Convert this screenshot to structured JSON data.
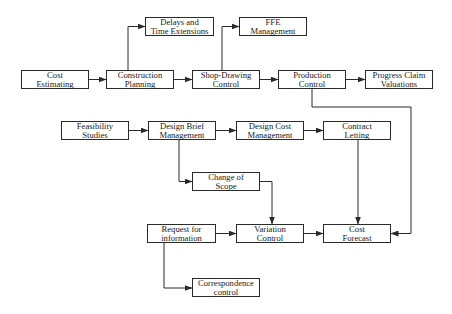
{
  "diagram": {
    "type": "flowchart",
    "colors": {
      "stroke": "#2a2a2a",
      "text": "#1a1a1a",
      "background": "#ffffff"
    },
    "nodes": [
      {
        "id": "cost_estimating",
        "label": "Cost\nEstimating",
        "x": 21,
        "y": 70,
        "w": 68,
        "h": 19
      },
      {
        "id": "construction_planning",
        "label": "Construction\nPlanning",
        "x": 106,
        "y": 70,
        "w": 68,
        "h": 19
      },
      {
        "id": "delays_time_extensions",
        "label": "Delays and\nTime Extensions",
        "x": 145,
        "y": 17,
        "w": 69,
        "h": 19
      },
      {
        "id": "shop_drawing_control",
        "label": "Shop-Drawing\nControl",
        "x": 192,
        "y": 70,
        "w": 68,
        "h": 19
      },
      {
        "id": "ffe_management",
        "label": "FFE\nManagement",
        "x": 239,
        "y": 17,
        "w": 68,
        "h": 19
      },
      {
        "id": "production_control",
        "label": "Production\nControl",
        "x": 278,
        "y": 70,
        "w": 68,
        "h": 19
      },
      {
        "id": "progress_claim_valuations",
        "label": "Progress Claim\nValuations",
        "x": 365,
        "y": 70,
        "w": 68,
        "h": 19
      },
      {
        "id": "feasibility_studies",
        "label": "Feasibility\nStudies",
        "x": 61,
        "y": 121,
        "w": 68,
        "h": 19
      },
      {
        "id": "design_brief_management",
        "label": "Design Brief\nManagement",
        "x": 148,
        "y": 121,
        "w": 68,
        "h": 19
      },
      {
        "id": "design_cost_management",
        "label": "Design Cost\nManagement",
        "x": 236,
        "y": 121,
        "w": 68,
        "h": 19
      },
      {
        "id": "contract_letting",
        "label": "Contract\nLetting",
        "x": 323,
        "y": 121,
        "w": 68,
        "h": 19
      },
      {
        "id": "change_of_scope",
        "label": "Change of\nScope",
        "x": 192,
        "y": 172,
        "w": 68,
        "h": 19
      },
      {
        "id": "request_for_information",
        "label": "Request for\ninformation",
        "x": 147,
        "y": 224,
        "w": 69,
        "h": 19
      },
      {
        "id": "variation_control",
        "label": "Variation\nControl",
        "x": 236,
        "y": 224,
        "w": 68,
        "h": 19
      },
      {
        "id": "cost_forecast",
        "label": "Cost\nForecast",
        "x": 323,
        "y": 224,
        "w": 68,
        "h": 19
      },
      {
        "id": "correspondence_control",
        "label": "Correspondence\ncontrol",
        "x": 192,
        "y": 278,
        "w": 68,
        "h": 19
      }
    ],
    "edges": [
      {
        "from": "cost_estimating",
        "to": "construction_planning",
        "points": [
          [
            89,
            79.5
          ],
          [
            106,
            79.5
          ]
        ]
      },
      {
        "from": "construction_planning",
        "to": "shop_drawing_control",
        "points": [
          [
            174,
            79.5
          ],
          [
            192,
            79.5
          ]
        ]
      },
      {
        "from": "shop_drawing_control",
        "to": "production_control",
        "points": [
          [
            260,
            79.5
          ],
          [
            278,
            79.5
          ]
        ]
      },
      {
        "from": "production_control",
        "to": "progress_claim_valuations",
        "points": [
          [
            346,
            79.5
          ],
          [
            365,
            79.5
          ]
        ]
      },
      {
        "from": "construction_planning",
        "to": "delays_time_extensions",
        "points": [
          [
            128,
            70
          ],
          [
            128,
            26.5
          ],
          [
            145,
            26.5
          ]
        ]
      },
      {
        "from": "shop_drawing_control",
        "to": "ffe_management",
        "points": [
          [
            222,
            70
          ],
          [
            222,
            26.5
          ],
          [
            239,
            26.5
          ]
        ]
      },
      {
        "from": "feasibility_studies",
        "to": "design_brief_management",
        "points": [
          [
            129,
            130.5
          ],
          [
            148,
            130.5
          ]
        ]
      },
      {
        "from": "design_brief_management",
        "to": "design_cost_management",
        "points": [
          [
            216,
            130.5
          ],
          [
            236,
            130.5
          ]
        ]
      },
      {
        "from": "design_cost_management",
        "to": "contract_letting",
        "points": [
          [
            304,
            130.5
          ],
          [
            323,
            130.5
          ]
        ]
      },
      {
        "from": "design_brief_management",
        "to": "change_of_scope",
        "points": [
          [
            179,
            140
          ],
          [
            179,
            181.5
          ],
          [
            192,
            181.5
          ]
        ]
      },
      {
        "from": "change_of_scope",
        "to": "variation_control",
        "points": [
          [
            260,
            181.5
          ],
          [
            272,
            181.5
          ],
          [
            272,
            224
          ]
        ]
      },
      {
        "from": "contract_letting",
        "to": "cost_forecast",
        "points": [
          [
            358,
            140
          ],
          [
            358,
            224
          ]
        ]
      },
      {
        "from": "production_control",
        "to": "cost_forecast",
        "points": [
          [
            312,
            89
          ],
          [
            312,
            107
          ],
          [
            411,
            107
          ],
          [
            411,
            233.5
          ],
          [
            391,
            233.5
          ]
        ]
      },
      {
        "from": "request_for_information",
        "to": "variation_control",
        "points": [
          [
            216,
            233.5
          ],
          [
            236,
            233.5
          ]
        ]
      },
      {
        "from": "variation_control",
        "to": "cost_forecast",
        "points": [
          [
            304,
            233.5
          ],
          [
            323,
            233.5
          ]
        ]
      },
      {
        "from": "request_for_information",
        "to": "correspondence_control",
        "points": [
          [
            164,
            243
          ],
          [
            164,
            288
          ],
          [
            192,
            288
          ]
        ]
      }
    ]
  }
}
